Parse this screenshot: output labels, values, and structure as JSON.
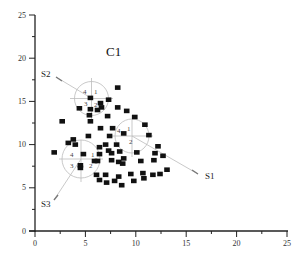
{
  "chart_data": {
    "type": "scatter",
    "title": "C1",
    "xlabel": "",
    "ylabel": "",
    "xlim": [
      0,
      25
    ],
    "ylim": [
      0,
      25
    ],
    "x_ticks": [
      0,
      5,
      10,
      15,
      20,
      25
    ],
    "y_ticks": [
      0,
      5,
      10,
      15,
      20,
      25
    ],
    "grid": false,
    "legend": null,
    "marker": "square",
    "marker_color": "#111111",
    "points": [
      [
        8.2,
        16.6
      ],
      [
        5.5,
        15.4
      ],
      [
        7.3,
        15.2
      ],
      [
        6.5,
        14.8
      ],
      [
        4.4,
        14.2
      ],
      [
        5.5,
        14.1
      ],
      [
        6.2,
        14.0
      ],
      [
        6.6,
        14.3
      ],
      [
        8.2,
        14.3
      ],
      [
        9.1,
        13.9
      ],
      [
        2.7,
        12.7
      ],
      [
        5.5,
        12.7
      ],
      [
        7.2,
        13.3
      ],
      [
        9.9,
        13.2
      ],
      [
        6.5,
        11.9
      ],
      [
        7.7,
        11.9
      ],
      [
        10.9,
        12.3
      ],
      [
        5.3,
        11.0
      ],
      [
        7.4,
        11.0
      ],
      [
        8.8,
        11.3
      ],
      [
        11.3,
        11.1
      ],
      [
        3.3,
        10.2
      ],
      [
        3.8,
        10.6
      ],
      [
        7.0,
        10.0
      ],
      [
        8.1,
        10.0
      ],
      [
        6.4,
        9.7
      ],
      [
        12.2,
        9.8
      ],
      [
        4.0,
        10.0
      ],
      [
        8.4,
        9.2
      ],
      [
        7.6,
        9.0
      ],
      [
        10.1,
        9.1
      ],
      [
        11.9,
        9.0
      ],
      [
        1.9,
        9.1
      ],
      [
        7.3,
        9.3
      ],
      [
        6.2,
        8.1
      ],
      [
        7.6,
        8.2
      ],
      [
        4.5,
        7.6
      ],
      [
        4.8,
        8.9
      ],
      [
        5.9,
        8.1
      ],
      [
        6.4,
        8.9
      ],
      [
        8.3,
        8.0
      ],
      [
        8.8,
        8.4
      ],
      [
        10.5,
        8.1
      ],
      [
        11.8,
        8.2
      ],
      [
        12.7,
        8.7
      ],
      [
        7.0,
        6.5
      ],
      [
        8.3,
        6.3
      ],
      [
        9.5,
        6.6
      ],
      [
        10.7,
        6.7
      ],
      [
        13.1,
        7.1
      ],
      [
        6.1,
        6.5
      ],
      [
        6.4,
        5.9
      ],
      [
        7.1,
        5.6
      ],
      [
        7.9,
        5.8
      ],
      [
        8.6,
        5.3
      ],
      [
        9.8,
        5.8
      ],
      [
        10.8,
        6.1
      ],
      [
        11.7,
        6.5
      ],
      [
        12.4,
        6.6
      ],
      [
        8.7,
        7.8
      ],
      [
        5.4,
        13.4
      ],
      [
        4.5,
        7.3
      ]
    ],
    "annotations": [
      {
        "label": "C1",
        "x": 9.6,
        "y": 20.6
      },
      {
        "label": "S1",
        "x": 17.2,
        "y": 6.1,
        "arrow_to": [
          10.8,
          9.8
        ]
      },
      {
        "label": "S2",
        "x": 0.8,
        "y": 18.0,
        "arrow_to": [
          4.7,
          17.2
        ]
      },
      {
        "label": "S3",
        "x": 0.7,
        "y": 3.1,
        "arrow_to": [
          3.3,
          4.8
        ]
      }
    ],
    "circles": [
      {
        "name": "S2",
        "center": [
          5.6,
          15.3
        ],
        "radius_px": 17,
        "quadrant_labels": [
          "1",
          "2",
          "3",
          "4"
        ]
      },
      {
        "name": "S1",
        "center": [
          9.6,
          10.3
        ],
        "radius_px": 17,
        "quadrant_labels": [
          "1",
          "2",
          "3",
          "4"
        ]
      },
      {
        "name": "S3",
        "center": [
          4.6,
          8.3
        ],
        "radius_px": 17,
        "quadrant_labels": [
          "1",
          "2",
          "3",
          "4"
        ]
      }
    ]
  },
  "labels": {
    "title": "C1",
    "s1": "S1",
    "s2": "S2",
    "s3": "S3",
    "q1": "1",
    "q2": "2",
    "q3": "3",
    "q4": "4"
  },
  "axes": {
    "x_ticks": [
      "0",
      "5",
      "10",
      "15",
      "20",
      "25"
    ],
    "y_ticks": [
      "0",
      "5",
      "10",
      "15",
      "20",
      "25"
    ]
  }
}
